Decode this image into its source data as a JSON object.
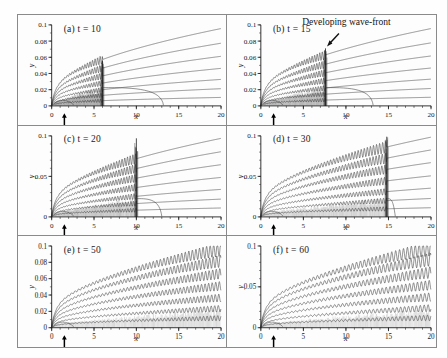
{
  "figure": {
    "panel_count": 6,
    "grid": {
      "columns": 2,
      "rows": 3
    },
    "frame_color": "#8a8a8a",
    "curve_color": "#3c3c3c",
    "background": "#fefefe"
  },
  "axes": {
    "x_label": "x",
    "y_label": "y",
    "x_min": 0,
    "x_max": 20,
    "x_ticks": [
      0,
      5,
      10,
      15,
      20
    ],
    "x_tick_labels": [
      "0",
      "5",
      "10",
      "15",
      "20"
    ],
    "x_minor_step": 1,
    "y_min": 0,
    "y_max": 0.1,
    "y_ticks_fine": [
      0,
      0.02,
      0.04,
      0.06,
      0.08,
      0.1
    ],
    "y_tick_labels_fine": [
      "0",
      "0.02",
      "0.04",
      "0.06",
      "0.08",
      "0.1"
    ],
    "y_ticks_coarse": [
      0,
      0.05,
      0.1
    ],
    "y_tick_labels_coarse": [
      "0",
      "0.05",
      "0.1"
    ],
    "arrow_marker_x": 1.5,
    "arrow_marker_note": "upward black arrow below x-axis"
  },
  "annotations": {
    "wave_front": {
      "text": "Developing wave-front",
      "panel": "b",
      "points_to_x": 7.6,
      "points_to_y": 0.071
    }
  },
  "panels": [
    {
      "id": "a",
      "label": "(a)  t = 10",
      "tag": "(a)",
      "time_label": "t = 10",
      "time": 10,
      "y_tick_mode": "fine",
      "front_x": 6.0,
      "front_height": 0.056,
      "osc_start_x": 0.55,
      "osc_amp": 0.004,
      "osc_wavelength": 0.3,
      "trailing_x": 13.2,
      "streamline_count": 7,
      "chart_data_ref": 0
    },
    {
      "id": "b",
      "label": "(b)  t = 15",
      "tag": "(b)",
      "time_label": "t = 15",
      "time": 15,
      "y_tick_mode": "fine",
      "front_x": 7.6,
      "front_height": 0.071,
      "osc_start_x": 0.55,
      "osc_amp": 0.0042,
      "osc_wavelength": 0.3,
      "trailing_x": 13.2,
      "streamline_count": 7,
      "chart_data_ref": 1
    },
    {
      "id": "c",
      "label": "(c)  t = 20",
      "tag": "(c)",
      "time_label": "t = 20",
      "time": 20,
      "y_tick_mode": "coarse",
      "front_x": 10.0,
      "front_height": 0.097,
      "osc_start_x": 0.55,
      "osc_amp": 0.0046,
      "osc_wavelength": 0.32,
      "trailing_x": 13.0,
      "streamline_count": 7,
      "chart_data_ref": 2
    },
    {
      "id": "d",
      "label": "(d)  t = 30",
      "tag": "(d)",
      "time_label": "t = 30",
      "time": 30,
      "y_tick_mode": "coarse",
      "front_x": 14.8,
      "front_height": 0.099,
      "osc_start_x": 0.55,
      "osc_amp": 0.005,
      "osc_wavelength": 0.36,
      "trailing_x": 15.8,
      "streamline_count": 7,
      "chart_data_ref": 3
    },
    {
      "id": "e",
      "label": "(e)  t = 50",
      "tag": "(e)",
      "time_label": "t = 50",
      "time": 50,
      "y_tick_mode": "fine",
      "front_x": 20.0,
      "front_height": 0.094,
      "osc_start_x": 0.55,
      "osc_amp": 0.0056,
      "osc_wavelength": 0.42,
      "trailing_x": 20.0,
      "streamline_count": 7,
      "chart_data_ref": 4
    },
    {
      "id": "f",
      "label": "(f)  t = 60",
      "tag": "(f)",
      "time_label": "t = 60",
      "time": 60,
      "y_tick_mode": "coarse",
      "front_x": 20.0,
      "front_height": 0.096,
      "osc_start_x": 0.55,
      "osc_amp": 0.006,
      "osc_wavelength": 0.46,
      "trailing_x": 20.0,
      "streamline_count": 7,
      "chart_data_ref": 5
    }
  ],
  "chart_data": [
    {
      "type": "line",
      "title": "(a)  t = 10",
      "xlabel": "x",
      "ylabel": "y",
      "xlim": [
        0,
        20
      ],
      "ylim": [
        0,
        0.1
      ],
      "grid": false,
      "legend": "none",
      "xticks": [
        0,
        5,
        10,
        15,
        20
      ],
      "yticks": [
        0,
        0.02,
        0.04,
        0.06,
        0.08,
        0.1
      ],
      "annotations": [],
      "series": [
        {
          "name": "streamline-1",
          "base_amplitude": 0.0215,
          "y_at_x20": 0.0955,
          "oscillating_to_x": 6.0
        },
        {
          "name": "streamline-2",
          "base_amplitude": 0.018,
          "y_at_x20": 0.077,
          "oscillating_to_x": 6.0
        },
        {
          "name": "streamline-3",
          "base_amplitude": 0.0148,
          "y_at_x20": 0.0605,
          "oscillating_to_x": 6.0
        },
        {
          "name": "streamline-4",
          "base_amplitude": 0.0116,
          "y_at_x20": 0.0455,
          "oscillating_to_x": 6.0
        },
        {
          "name": "streamline-5",
          "base_amplitude": 0.0086,
          "y_at_x20": 0.0318,
          "oscillating_to_x": 6.0
        },
        {
          "name": "streamline-6",
          "base_amplitude": 0.0058,
          "y_at_x20": 0.0205,
          "oscillating_to_x": 6.0
        },
        {
          "name": "streamline-7",
          "base_amplitude": 0.003,
          "y_at_x20": 0.01,
          "oscillating_to_x": 6.0
        }
      ],
      "wave_front_x": 6.0,
      "separation_bubble_x": 13.2
    },
    {
      "type": "line",
      "title": "(b)  t = 15",
      "xlabel": "x",
      "ylabel": "y",
      "xlim": [
        0,
        20
      ],
      "ylim": [
        0,
        0.1
      ],
      "grid": false,
      "legend": "none",
      "xticks": [
        0,
        5,
        10,
        15,
        20
      ],
      "yticks": [
        0,
        0.02,
        0.04,
        0.06,
        0.08,
        0.1
      ],
      "annotations": [
        {
          "text": "Developing wave-front",
          "x": 7.6,
          "y": 0.071
        }
      ],
      "series": [
        {
          "name": "streamline-1",
          "base_amplitude": 0.0215,
          "y_at_x20": 0.0955,
          "oscillating_to_x": 7.6
        },
        {
          "name": "streamline-2",
          "base_amplitude": 0.018,
          "y_at_x20": 0.0775,
          "oscillating_to_x": 7.6
        },
        {
          "name": "streamline-3",
          "base_amplitude": 0.0148,
          "y_at_x20": 0.061,
          "oscillating_to_x": 7.6
        },
        {
          "name": "streamline-4",
          "base_amplitude": 0.0116,
          "y_at_x20": 0.046,
          "oscillating_to_x": 7.6
        },
        {
          "name": "streamline-5",
          "base_amplitude": 0.0086,
          "y_at_x20": 0.0322,
          "oscillating_to_x": 7.6
        },
        {
          "name": "streamline-6",
          "base_amplitude": 0.0058,
          "y_at_x20": 0.0208,
          "oscillating_to_x": 7.6
        },
        {
          "name": "streamline-7",
          "base_amplitude": 0.003,
          "y_at_x20": 0.0102,
          "oscillating_to_x": 7.6
        }
      ],
      "wave_front_x": 7.6,
      "separation_bubble_x": 13.2
    },
    {
      "type": "line",
      "title": "(c)  t = 20",
      "xlabel": "x",
      "ylabel": "y",
      "xlim": [
        0,
        20
      ],
      "ylim": [
        0,
        0.1
      ],
      "grid": false,
      "legend": "none",
      "xticks": [
        0,
        5,
        10,
        15,
        20
      ],
      "yticks": [
        0,
        0.05,
        0.1
      ],
      "annotations": [],
      "series": [
        {
          "name": "streamline-1",
          "base_amplitude": 0.0225,
          "y_at_x20": 0.0965,
          "oscillating_to_x": 10.0
        },
        {
          "name": "streamline-2",
          "base_amplitude": 0.0188,
          "y_at_x20": 0.08,
          "oscillating_to_x": 10.0
        },
        {
          "name": "streamline-3",
          "base_amplitude": 0.0152,
          "y_at_x20": 0.064,
          "oscillating_to_x": 10.0
        },
        {
          "name": "streamline-4",
          "base_amplitude": 0.012,
          "y_at_x20": 0.048,
          "oscillating_to_x": 10.0
        },
        {
          "name": "streamline-5",
          "base_amplitude": 0.009,
          "y_at_x20": 0.033,
          "oscillating_to_x": 10.0
        },
        {
          "name": "streamline-6",
          "base_amplitude": 0.006,
          "y_at_x20": 0.0212,
          "oscillating_to_x": 10.0
        },
        {
          "name": "streamline-7",
          "base_amplitude": 0.0032,
          "y_at_x20": 0.0105,
          "oscillating_to_x": 10.0
        }
      ],
      "wave_front_x": 10.0,
      "separation_bubble_x": 13.0
    },
    {
      "type": "line",
      "title": "(d)  t = 30",
      "xlabel": "x",
      "ylabel": "y",
      "xlim": [
        0,
        20
      ],
      "ylim": [
        0,
        0.1
      ],
      "grid": false,
      "legend": "none",
      "xticks": [
        0,
        5,
        10,
        15,
        20
      ],
      "yticks": [
        0,
        0.05,
        0.1
      ],
      "annotations": [],
      "series": [
        {
          "name": "streamline-1",
          "base_amplitude": 0.0235,
          "y_at_x20": 0.0975,
          "oscillating_to_x": 14.8
        },
        {
          "name": "streamline-2",
          "base_amplitude": 0.0196,
          "y_at_x20": 0.082,
          "oscillating_to_x": 14.8
        },
        {
          "name": "streamline-3",
          "base_amplitude": 0.0158,
          "y_at_x20": 0.0665,
          "oscillating_to_x": 14.8
        },
        {
          "name": "streamline-4",
          "base_amplitude": 0.0124,
          "y_at_x20": 0.05,
          "oscillating_to_x": 14.8
        },
        {
          "name": "streamline-5",
          "base_amplitude": 0.0094,
          "y_at_x20": 0.0345,
          "oscillating_to_x": 14.8
        },
        {
          "name": "streamline-6",
          "base_amplitude": 0.0062,
          "y_at_x20": 0.022,
          "oscillating_to_x": 14.8
        },
        {
          "name": "streamline-7",
          "base_amplitude": 0.0033,
          "y_at_x20": 0.0108,
          "oscillating_to_x": 14.8
        }
      ],
      "wave_front_x": 14.8,
      "separation_bubble_x": 15.8
    },
    {
      "type": "line",
      "title": "(e)  t = 50",
      "xlabel": "x",
      "ylabel": "y",
      "xlim": [
        0,
        20
      ],
      "ylim": [
        0,
        0.1
      ],
      "grid": false,
      "legend": "none",
      "xticks": [
        0,
        5,
        10,
        15,
        20
      ],
      "yticks": [
        0,
        0.02,
        0.04,
        0.06,
        0.08,
        0.1
      ],
      "annotations": [],
      "series": [
        {
          "name": "streamline-1",
          "base_amplitude": 0.0245,
          "y_at_x20": 0.094,
          "oscillating_to_x": 20.0
        },
        {
          "name": "streamline-2",
          "base_amplitude": 0.0205,
          "y_at_x20": 0.08,
          "oscillating_to_x": 20.0
        },
        {
          "name": "streamline-3",
          "base_amplitude": 0.0165,
          "y_at_x20": 0.065,
          "oscillating_to_x": 20.0
        },
        {
          "name": "streamline-4",
          "base_amplitude": 0.013,
          "y_at_x20": 0.05,
          "oscillating_to_x": 20.0
        },
        {
          "name": "streamline-5",
          "base_amplitude": 0.0098,
          "y_at_x20": 0.0355,
          "oscillating_to_x": 20.0
        },
        {
          "name": "streamline-6",
          "base_amplitude": 0.0066,
          "y_at_x20": 0.0225,
          "oscillating_to_x": 20.0
        },
        {
          "name": "streamline-7",
          "base_amplitude": 0.0034,
          "y_at_x20": 0.0112,
          "oscillating_to_x": 20.0
        }
      ],
      "wave_front_x": 20.0,
      "separation_bubble_x": 20.0
    },
    {
      "type": "line",
      "title": "(f)  t = 60",
      "xlabel": "x",
      "ylabel": "y",
      "xlim": [
        0,
        20
      ],
      "ylim": [
        0,
        0.1
      ],
      "grid": false,
      "legend": "none",
      "xticks": [
        0,
        5,
        10,
        15,
        20
      ],
      "yticks": [
        0,
        0.05,
        0.1
      ],
      "annotations": [],
      "series": [
        {
          "name": "streamline-1",
          "base_amplitude": 0.025,
          "y_at_x20": 0.095,
          "oscillating_to_x": 20.0
        },
        {
          "name": "streamline-2",
          "base_amplitude": 0.021,
          "y_at_x20": 0.082,
          "oscillating_to_x": 20.0
        },
        {
          "name": "streamline-3",
          "base_amplitude": 0.017,
          "y_at_x20": 0.0665,
          "oscillating_to_x": 20.0
        },
        {
          "name": "streamline-4",
          "base_amplitude": 0.0134,
          "y_at_x20": 0.051,
          "oscillating_to_x": 20.0
        },
        {
          "name": "streamline-5",
          "base_amplitude": 0.01,
          "y_at_x20": 0.0365,
          "oscillating_to_x": 20.0
        },
        {
          "name": "streamline-6",
          "base_amplitude": 0.0068,
          "y_at_x20": 0.023,
          "oscillating_to_x": 20.0
        },
        {
          "name": "streamline-7",
          "base_amplitude": 0.0035,
          "y_at_x20": 0.0115,
          "oscillating_to_x": 20.0
        }
      ],
      "wave_front_x": 20.0,
      "separation_bubble_x": 20.0
    }
  ]
}
